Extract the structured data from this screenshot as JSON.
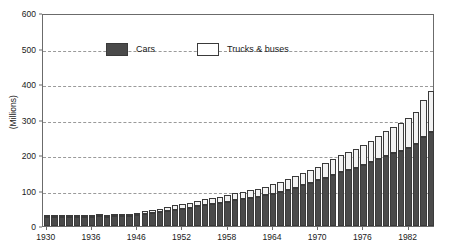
{
  "chart_data": {
    "type": "bar",
    "subtype": "stacked-bar",
    "title": "",
    "xlabel": "",
    "ylabel": "(Millions)",
    "ylim": [
      0,
      600
    ],
    "ytick_step": 100,
    "grid": true,
    "grid_style": "dashed-horizontal",
    "legend_position": "top-left-inside",
    "note": "War years 1942-1945 are omitted from the category axis",
    "yticks": [
      0,
      100,
      200,
      300,
      400,
      500,
      600
    ],
    "xtick_labels": [
      "1930",
      "1936",
      "1946",
      "1952",
      "1958",
      "1964",
      "1970",
      "1976",
      "1982"
    ],
    "categories": [
      "1930",
      "1931",
      "1932",
      "1933",
      "1934",
      "1935",
      "1936",
      "1937",
      "1938",
      "1939",
      "1940",
      "1941",
      "1946",
      "1947",
      "1948",
      "1949",
      "1950",
      "1951",
      "1952",
      "1953",
      "1954",
      "1955",
      "1956",
      "1957",
      "1958",
      "1959",
      "1960",
      "1961",
      "1962",
      "1963",
      "1964",
      "1965",
      "1966",
      "1967",
      "1968",
      "1969",
      "1970",
      "1971",
      "1972",
      "1973",
      "1974",
      "1975",
      "1976",
      "1977",
      "1978",
      "1979",
      "1980",
      "1981",
      "1982",
      "1983",
      "1984",
      "1985"
    ],
    "series": [
      {
        "name": "Cars",
        "color": "#4a4a4a",
        "values": [
          25,
          25,
          24,
          24,
          24,
          25,
          26,
          27,
          26,
          27,
          28,
          29,
          31,
          34,
          36,
          39,
          43,
          46,
          49,
          52,
          55,
          59,
          62,
          65,
          68,
          72,
          76,
          79,
          82,
          86,
          91,
          96,
          102,
          108,
          115,
          122,
          129,
          136,
          144,
          153,
          159,
          164,
          172,
          180,
          189,
          198,
          205,
          212,
          220,
          230,
          250,
          265
        ]
      },
      {
        "name": "Trucks & buses",
        "color": "#f2f2f2",
        "values": [
          3,
          3,
          3,
          3,
          3,
          4,
          4,
          4,
          4,
          5,
          5,
          5,
          7,
          8,
          9,
          10,
          11,
          12,
          13,
          14,
          15,
          16,
          17,
          18,
          19,
          20,
          21,
          22,
          23,
          24,
          26,
          28,
          30,
          32,
          34,
          36,
          38,
          41,
          44,
          47,
          50,
          52,
          56,
          60,
          65,
          70,
          74,
          78,
          83,
          90,
          105,
          115
        ]
      }
    ]
  },
  "legend": {
    "entries": [
      {
        "label": "Cars"
      },
      {
        "label": "Trucks & buses"
      }
    ]
  }
}
